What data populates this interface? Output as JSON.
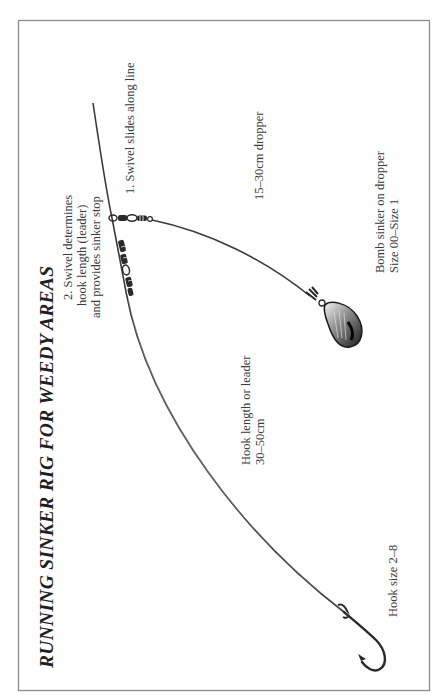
{
  "figure": {
    "title": "RUNNING SINKER RIG FOR WEEDY AREAS",
    "border_color": "#8c8c8c",
    "line_color": "#3a3a3a",
    "labels": {
      "swivel_stop": [
        "2. Swivel determines",
        "hook length (leader)",
        "and provides sinker stop"
      ],
      "swivel_slides": "1. Swivel slides along line",
      "dropper": "15–30cm dropper",
      "sinker": [
        "Bomb sinker on dropper",
        "Size 00–Size 1"
      ],
      "leader": [
        "Hook length or leader",
        "30–50cm"
      ],
      "hook": "Hook size 2–8"
    },
    "components": [
      {
        "name": "main-line",
        "icon": "fishing-line"
      },
      {
        "name": "running-swivel",
        "icon": "swivel-icon"
      },
      {
        "name": "stop-swivel",
        "icon": "swivel-icon"
      },
      {
        "name": "dropper-line",
        "icon": "fishing-line"
      },
      {
        "name": "bomb-sinker",
        "icon": "sinker-icon"
      },
      {
        "name": "hook",
        "icon": "hook-icon"
      }
    ]
  }
}
